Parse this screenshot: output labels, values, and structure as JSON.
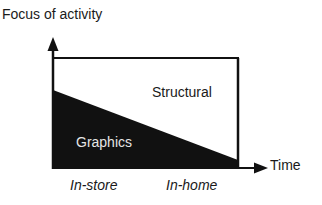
{
  "diagram": {
    "y_axis_label": "Focus of activity",
    "x_axis_label": "Time",
    "regions": {
      "upper": "Structural",
      "lower": "Graphics"
    },
    "x_categories": [
      "In-store",
      "In-home"
    ],
    "colors": {
      "line": "#111111",
      "graphics_fill": "#111111",
      "graphics_text": "#e6e6e6",
      "background": "#ffffff"
    }
  }
}
